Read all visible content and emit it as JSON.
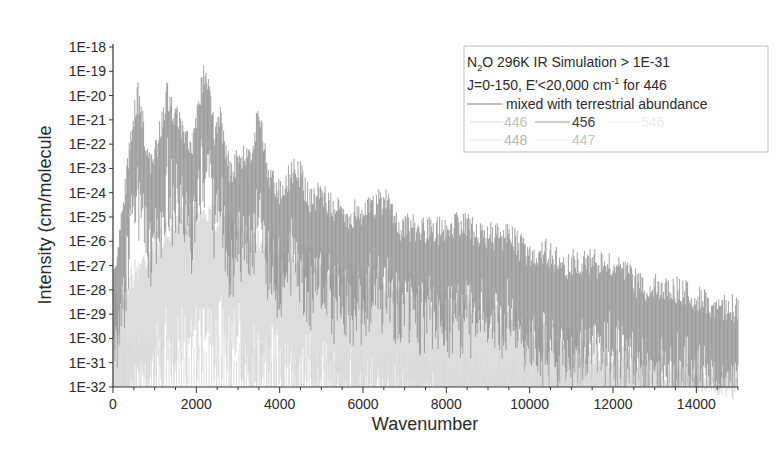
{
  "chart_data": {
    "type": "line",
    "title": "",
    "xlabel": "Wavenumber",
    "ylabel": "Intensity (cm/molecule",
    "xlim": [
      0,
      15000
    ],
    "ylim_log10": [
      -32,
      -18
    ],
    "yscale": "log",
    "grid": false,
    "x_ticks": [
      0,
      2000,
      4000,
      6000,
      8000,
      10000,
      12000,
      14000
    ],
    "x_tick_labels": [
      "0",
      "2000",
      "4000",
      "6000",
      "8000",
      "10000",
      "12000",
      "14000"
    ],
    "y_tick_labels": [
      "1E-18",
      "1E-19",
      "1E-20",
      "1E-21",
      "1E-22",
      "1E-23",
      "1E-24",
      "1E-25",
      "1E-26",
      "1E-27",
      "1E-28",
      "1E-29",
      "1E-30",
      "1E-31",
      "1E-32"
    ],
    "legend": {
      "placement": "top-right",
      "title_line1_prefix": "N",
      "title_line1_sub": "2",
      "title_line1_suffix": "O 296K IR Simulation > 1E-31",
      "title_line2_prefix": "J=0-150, E'<20,000 cm",
      "title_line2_sup": "-1",
      "title_line2_suffix": " for 446",
      "entries": [
        {
          "label": "mixed with terrestrial abundance",
          "color": "#7a7a7a"
        },
        {
          "label": "446",
          "color": "#c8c8c8"
        },
        {
          "label": "456",
          "color": "#3a3a3a"
        },
        {
          "label": "546",
          "color": "#eeeeee"
        },
        {
          "label": "448",
          "color": "#b8b8b8"
        },
        {
          "label": "447",
          "color": "#c4c4c4"
        }
      ]
    },
    "series": [
      {
        "name": "mixed with terrestrial abundance (band envelope peaks)",
        "x": [
          0,
          590,
          900,
          1170,
          1285,
          1880,
          2220,
          2460,
          2560,
          2800,
          3370,
          3480,
          3750,
          4000,
          4420,
          4730,
          5000,
          5200,
          5600,
          6300,
          6580,
          6900,
          7350,
          7800,
          8350,
          8800,
          9500,
          10000,
          10350,
          10800,
          11300,
          12200,
          12750,
          13200,
          14000,
          14400,
          15000
        ],
        "log10_intensity": [
          -27,
          -19.3,
          -22.5,
          -20.6,
          -19.3,
          -21.8,
          -18.1,
          -21.1,
          -20.3,
          -22.5,
          -21.6,
          -19.9,
          -22.8,
          -23.3,
          -22.3,
          -23.8,
          -23.3,
          -24.0,
          -24.4,
          -23.9,
          -23.7,
          -24.8,
          -24.9,
          -25.0,
          -24.6,
          -25.2,
          -25.2,
          -26.0,
          -25.8,
          -26.4,
          -26.2,
          -26.6,
          -27.4,
          -27.2,
          -27.7,
          -28.0,
          -28.2
        ]
      },
      {
        "name": "minor isotopologues (446/456/546/448/447) upper envelope",
        "x": [
          0,
          1000,
          2000,
          3000,
          4000,
          5000,
          6000,
          7000,
          8000,
          9000,
          10000,
          11000,
          12000,
          13000,
          14000,
          15000
        ],
        "log10_intensity": [
          -28,
          -25.5,
          -24.0,
          -25.0,
          -25.6,
          -26.3,
          -26.8,
          -27.2,
          -27.8,
          -28.4,
          -29.0,
          -29.6,
          -30.2,
          -30.6,
          -31.0,
          -31.5
        ]
      }
    ]
  }
}
